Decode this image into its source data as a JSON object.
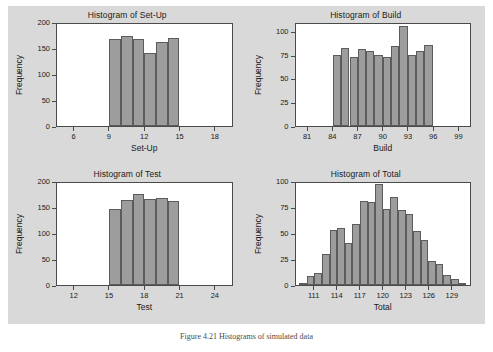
{
  "figure": {
    "caption": "Figure 4.21   Histograms of simulated data",
    "background_color": "#d9d9d9",
    "bar_color": "#9d9d9d",
    "bar_edge_color": "#5c5c5c",
    "axis_color": "#4a4a4a",
    "plot_background": "#ffffff"
  },
  "chart_data": [
    {
      "type": "bar",
      "panel": "top-left",
      "title": "Histogram of Set-Up",
      "xlabel": "Set-Up",
      "ylabel": "Frequency",
      "xlim": [
        4.5,
        19.5
      ],
      "ylim": [
        0,
        200
      ],
      "xticks": [
        6,
        9,
        12,
        15,
        18
      ],
      "yticks": [
        0,
        50,
        100,
        150,
        200
      ],
      "bin_width": 1,
      "bin_starts": [
        9,
        10,
        11,
        12,
        13,
        14
      ],
      "categories": [
        "9-10",
        "10-11",
        "11-12",
        "12-13",
        "13-14",
        "14-15"
      ],
      "values": [
        171,
        176,
        171,
        143,
        165,
        173
      ],
      "grid": false,
      "legend": "none"
    },
    {
      "type": "bar",
      "panel": "top-right",
      "title": "Histogram of Build",
      "xlabel": "Build",
      "ylabel": "Frequency",
      "xlim": [
        79.5,
        100.5
      ],
      "ylim": [
        0,
        110
      ],
      "xticks": [
        81,
        84,
        87,
        90,
        93,
        96,
        99
      ],
      "yticks": [
        0,
        25,
        50,
        75,
        100
      ],
      "bin_width": 1,
      "bin_starts": [
        84,
        85,
        86,
        87,
        88,
        89,
        90,
        91,
        92,
        93,
        94,
        95
      ],
      "categories": [
        "84-85",
        "85-86",
        "86-87",
        "87-88",
        "88-89",
        "89-90",
        "90-91",
        "91-92",
        "92-93",
        "93-94",
        "94-95",
        "95-96"
      ],
      "values": [
        77,
        84,
        74,
        83,
        81,
        77,
        74,
        86,
        108,
        77,
        81,
        87
      ],
      "grid": false,
      "legend": "none"
    },
    {
      "type": "bar",
      "panel": "bottom-left",
      "title": "Histogram of Test",
      "xlabel": "Test",
      "ylabel": "Frequency",
      "xlim": [
        10.5,
        25.5
      ],
      "ylim": [
        0,
        200
      ],
      "xticks": [
        12,
        15,
        18,
        21,
        24
      ],
      "yticks": [
        0,
        50,
        100,
        150,
        200
      ],
      "bin_width": 1,
      "bin_starts": [
        15,
        16,
        17,
        18,
        19,
        20
      ],
      "categories": [
        "15-16",
        "16-17",
        "17-18",
        "18-19",
        "19-20",
        "20-21"
      ],
      "values": [
        150,
        167,
        179,
        169,
        170,
        165
      ],
      "grid": false,
      "legend": "none"
    },
    {
      "type": "bar",
      "panel": "bottom-right",
      "title": "Histogram of Total",
      "xlabel": "Total",
      "ylabel": "Frequency",
      "xlim": [
        108.5,
        131.5
      ],
      "ylim": [
        0,
        100
      ],
      "xticks": [
        111,
        114,
        117,
        120,
        123,
        126,
        129
      ],
      "yticks": [
        0,
        25,
        50,
        75,
        100
      ],
      "bin_width": 1,
      "bin_starts": [
        109,
        110,
        111,
        112,
        113,
        114,
        115,
        116,
        117,
        118,
        119,
        120,
        121,
        122,
        123,
        124,
        125,
        126,
        127,
        128,
        129,
        130
      ],
      "categories": [
        "109-110",
        "110-111",
        "111-112",
        "112-113",
        "113-114",
        "114-115",
        "115-116",
        "116-117",
        "117-118",
        "118-119",
        "119-120",
        "120-121",
        "121-122",
        "122-123",
        "123-124",
        "124-125",
        "125-126",
        "126-127",
        "127-128",
        "128-129",
        "129-130",
        "130-131"
      ],
      "values": [
        2,
        9,
        12,
        30,
        54,
        56,
        41,
        60,
        82,
        81,
        99,
        75,
        86,
        74,
        70,
        53,
        44,
        24,
        21,
        10,
        6,
        1
      ],
      "grid": false,
      "legend": "none"
    }
  ]
}
